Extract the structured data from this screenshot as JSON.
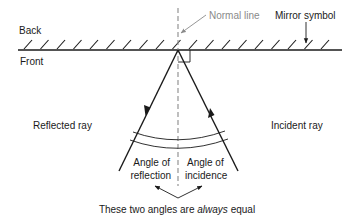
{
  "diagram": {
    "labels": {
      "back": "Back",
      "front": "Front",
      "normal_line": "Normal line",
      "mirror_symbol": "Mirror symbol",
      "reflected_ray": "Reflected ray",
      "incident_ray": "Incident ray",
      "angle_reflection_line1": "Angle of",
      "angle_reflection_line2": "reflection",
      "angle_incidence_line1": "Angle of",
      "angle_incidence_line2": "incidence",
      "caption_prefix": "These two angles are ",
      "caption_emphasis": "always",
      "caption_suffix": " equal"
    },
    "colors": {
      "line": "#1a1a1a",
      "normal": "#8a8a8a",
      "background": "#ffffff"
    }
  }
}
